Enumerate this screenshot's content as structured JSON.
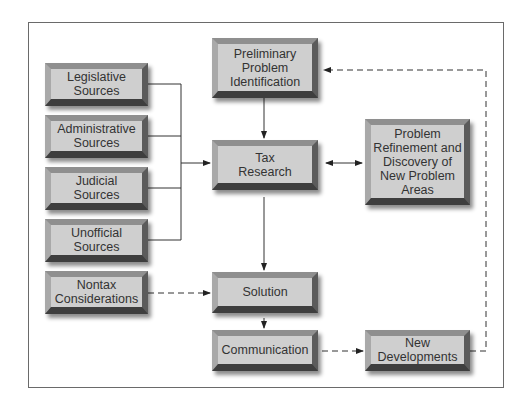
{
  "diagram": {
    "nodes": {
      "legislative": {
        "label": "Legislative\nSources"
      },
      "administrative": {
        "label": "Administrative\nSources"
      },
      "judicial": {
        "label": "Judicial\nSources"
      },
      "unofficial": {
        "label": "Unofficial\nSources"
      },
      "nontax": {
        "label": "Nontax\nConsiderations"
      },
      "preliminary": {
        "label": "Preliminary\nProblem\nIdentification"
      },
      "tax_research": {
        "label": "Tax\nResearch"
      },
      "solution": {
        "label": "Solution"
      },
      "communication": {
        "label": "Communication"
      },
      "refinement": {
        "label": "Problem\nRefinement and\nDiscovery of\nNew Problem\nAreas"
      },
      "new_developments": {
        "label": "New\nDevelopments"
      }
    },
    "edges": [
      {
        "from": "legislative",
        "to": "tax_research",
        "style": "solid"
      },
      {
        "from": "administrative",
        "to": "tax_research",
        "style": "solid"
      },
      {
        "from": "judicial",
        "to": "tax_research",
        "style": "solid"
      },
      {
        "from": "unofficial",
        "to": "tax_research",
        "style": "solid"
      },
      {
        "from": "preliminary",
        "to": "tax_research",
        "style": "solid"
      },
      {
        "from": "tax_research",
        "to": "refinement",
        "style": "solid",
        "bidirectional": true
      },
      {
        "from": "tax_research",
        "to": "solution",
        "style": "solid"
      },
      {
        "from": "nontax",
        "to": "solution",
        "style": "dashed"
      },
      {
        "from": "solution",
        "to": "communication",
        "style": "solid"
      },
      {
        "from": "communication",
        "to": "new_developments",
        "style": "dashed"
      },
      {
        "from": "new_developments",
        "to": "preliminary",
        "style": "dashed"
      }
    ],
    "colors": {
      "box_face": "#cfcfcf",
      "box_dark": "#3e3e3e",
      "line": "#333333",
      "frame": "#6a6a6a"
    }
  }
}
